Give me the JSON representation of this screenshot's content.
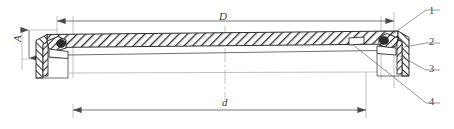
{
  "drawing": {
    "type": "engineering-cross-section",
    "description": "Sectional view of a circular cover/lid assembly with sealing rim",
    "dimensions": [
      {
        "id": "D",
        "label": "D",
        "orientation": "horizontal",
        "position": "top",
        "meaning": "outer diameter"
      },
      {
        "id": "d",
        "label": "d",
        "orientation": "horizontal",
        "position": "bottom",
        "meaning": "inner diameter"
      },
      {
        "id": "A",
        "label": "A",
        "orientation": "vertical",
        "position": "left",
        "meaning": "height"
      }
    ],
    "callouts": [
      {
        "id": "1",
        "label": "1"
      },
      {
        "id": "2",
        "label": "2"
      },
      {
        "id": "3",
        "label": "3"
      },
      {
        "id": "4",
        "label": "4"
      }
    ],
    "colors": {
      "line": "#4a4a4a",
      "thin_line": "#9a9a9a",
      "hatch": "#2e2e2e",
      "fill": "#ffffff",
      "background": "#ffffff"
    }
  }
}
